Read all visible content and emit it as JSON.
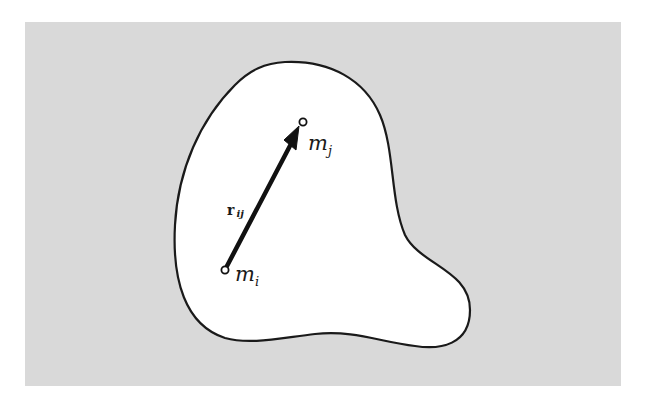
{
  "figure": {
    "background_color": "#d9d9d9",
    "body_fill": "#ffffff",
    "outline_color": "#1a1a1a",
    "body_label": "rigid body (arbitrary shape)"
  },
  "points": {
    "mi": {
      "symbol": "m",
      "subscript": "i",
      "x": 225,
      "y": 270
    },
    "mj": {
      "symbol": "m",
      "subscript": "j",
      "x": 303,
      "y": 122
    }
  },
  "vector": {
    "symbol": "r",
    "subscript": "ij",
    "from": "mi",
    "to": "mj",
    "icon": "arrow-icon"
  }
}
